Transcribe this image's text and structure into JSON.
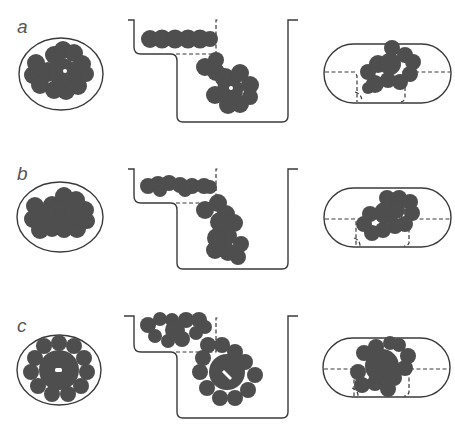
{
  "figure": {
    "panels": [
      {
        "label": "a",
        "description": "Molecule in cross-section view within elliptical boundary; stepped container with flat and rotated conformations; capsule side view",
        "cross_section_shape": "ellipse",
        "container_shape": "stepped-well",
        "side_view_shape": "capsule",
        "has_center_hole": true
      },
      {
        "label": "b",
        "description": "Alternative conformation packed in ellipse; stepped container; capsule side view",
        "cross_section_shape": "ellipse",
        "container_shape": "stepped-well",
        "side_view_shape": "capsule",
        "has_center_hole": false
      },
      {
        "label": "c",
        "description": "Symmetric flower-shaped molecule in ellipse; stepped container; capsule side view",
        "cross_section_shape": "ellipse",
        "container_shape": "stepped-well",
        "side_view_shape": "capsule",
        "has_center_hole": true
      }
    ],
    "colors": {
      "molecule_fill": "#4e4e4e",
      "outline": "#3a3a3a",
      "label": "#555555",
      "background": "#ffffff"
    }
  }
}
